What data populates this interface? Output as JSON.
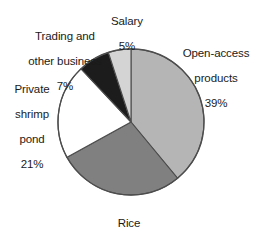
{
  "chart_data": {
    "type": "pie",
    "title": "",
    "subtitle": "",
    "xlabel": "",
    "ylabel": "",
    "legend_position": "none",
    "grid": false,
    "units": "percent",
    "start_angle_deg": 0,
    "direction": "clockwise",
    "categories": [
      "Open-access products",
      "Rice",
      "Private shrimp pond",
      "Trading and other business",
      "Salary"
    ],
    "values": [
      39,
      28,
      21,
      7,
      5
    ],
    "slices": [
      {
        "id": "open-access-products",
        "label": "Open-access\nproducts",
        "label_line1": "Open-access",
        "label_line2": "products",
        "value": 39,
        "value_text": "39%",
        "color": "#b5b5b5",
        "start_deg": 0,
        "end_deg": 140.4
      },
      {
        "id": "rice",
        "label": "Rice",
        "label_line1": "Rice",
        "value": 28,
        "value_text": "28%",
        "color": "#808080",
        "start_deg": 140.4,
        "end_deg": 241.2
      },
      {
        "id": "private-shrimp-pond",
        "label": "Private\nshrimp\npond",
        "label_line1": "Private",
        "label_line2": "shrimp",
        "label_line3": "pond",
        "value": 21,
        "value_text": "21%",
        "color": "#ffffff",
        "start_deg": 241.2,
        "end_deg": 316.8
      },
      {
        "id": "trading-and-other-business",
        "label": "Trading and\nother business",
        "label_line1": "Trading and",
        "label_line2": "other business",
        "value": 7,
        "value_text": "7%",
        "color": "#1c1c1c",
        "start_deg": 316.8,
        "end_deg": 342.0
      },
      {
        "id": "salary",
        "label": "Salary",
        "label_line1": "Salary",
        "value": 5,
        "value_text": "5%",
        "color": "#d4d4d4",
        "start_deg": 342.0,
        "end_deg": 360.0
      }
    ],
    "outline_color": "#4d4d4d",
    "background_color": "#ffffff",
    "text_color": "#1a1a1a"
  }
}
